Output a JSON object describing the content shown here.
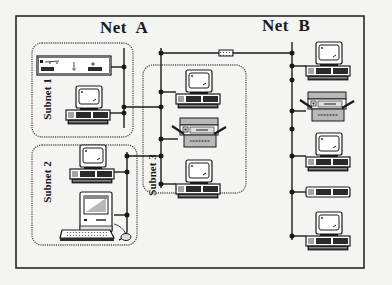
{
  "diagram": {
    "type": "network-topology",
    "networks": [
      {
        "id": "net-a",
        "label": "Net  A"
      },
      {
        "id": "net-b",
        "label": "Net  B"
      }
    ],
    "subnets": [
      {
        "id": "subnet-1",
        "label": "Subnet 1",
        "devices": [
          "rack-server",
          "desktop-computer"
        ]
      },
      {
        "id": "subnet-2",
        "label": "Subnet 2",
        "devices": [
          "desktop-computer",
          "macintosh-computer"
        ]
      },
      {
        "id": "subnet-3",
        "label": "Subnet 3",
        "devices": [
          "desktop-computer",
          "printer",
          "desktop-computer"
        ]
      }
    ],
    "net_b_devices": [
      "desktop-computer",
      "printer",
      "desktop-computer",
      "system-unit",
      "desktop-computer"
    ],
    "links": [
      {
        "from": "net-a",
        "to": "net-b",
        "via": "repeater"
      },
      {
        "from": "subnet-1",
        "to": "net-a"
      },
      {
        "from": "subnet-2",
        "to": "net-a"
      },
      {
        "from": "subnet-3",
        "to": "net-a"
      }
    ],
    "colors": {
      "background": "#f4f4f2",
      "line": "#1a1a1a",
      "device_fill": "#ffffff",
      "device_dark": "#2a2a2a",
      "device_grey": "#b8b8b8"
    }
  }
}
